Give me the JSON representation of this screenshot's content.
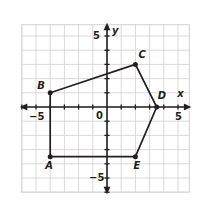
{
  "figure": {
    "kind": "coordinate-plane-polygon",
    "background": "#ffffff",
    "grid_color": "#d9d9d9",
    "axis_color": "#231f20",
    "shape_color": "#231f20"
  },
  "axes": {
    "x_label": "x",
    "y_label": "y",
    "origin_label": "0",
    "x_min": -6.0,
    "x_max": 5.8,
    "y_min": -6.0,
    "y_max": 5.8,
    "x_ticks": [
      -5,
      5
    ],
    "y_ticks": [
      5,
      -5
    ],
    "x_tick_labels": [
      "−5",
      "5"
    ],
    "y_tick_labels": [
      "5",
      "−5"
    ],
    "grid": true,
    "grid_step": 1
  },
  "chart_data": {
    "type": "scatter",
    "title": "",
    "xlabel": "x",
    "ylabel": "y",
    "xlim": [
      -6.0,
      5.8
    ],
    "ylim": [
      -6.0,
      5.8
    ],
    "grid": true,
    "legend": "none",
    "series": [
      {
        "name": "Pentagon ABCDE",
        "closed": true,
        "points": [
          {
            "label": "A",
            "x": -4.0,
            "y": -3.5,
            "label_dx": -2,
            "label_dy": 12
          },
          {
            "label": "B",
            "x": -4.0,
            "y": 1.0,
            "label_dx": -10,
            "label_dy": -4
          },
          {
            "label": "C",
            "x": 2.0,
            "y": 3.0,
            "label_dx": 6,
            "label_dy": -6
          },
          {
            "label": "D",
            "x": 3.5,
            "y": 0.0,
            "label_dx": 4,
            "label_dy": -8
          },
          {
            "label": "E",
            "x": 2.0,
            "y": -3.5,
            "label_dx": 1,
            "label_dy": 12
          }
        ]
      }
    ]
  }
}
